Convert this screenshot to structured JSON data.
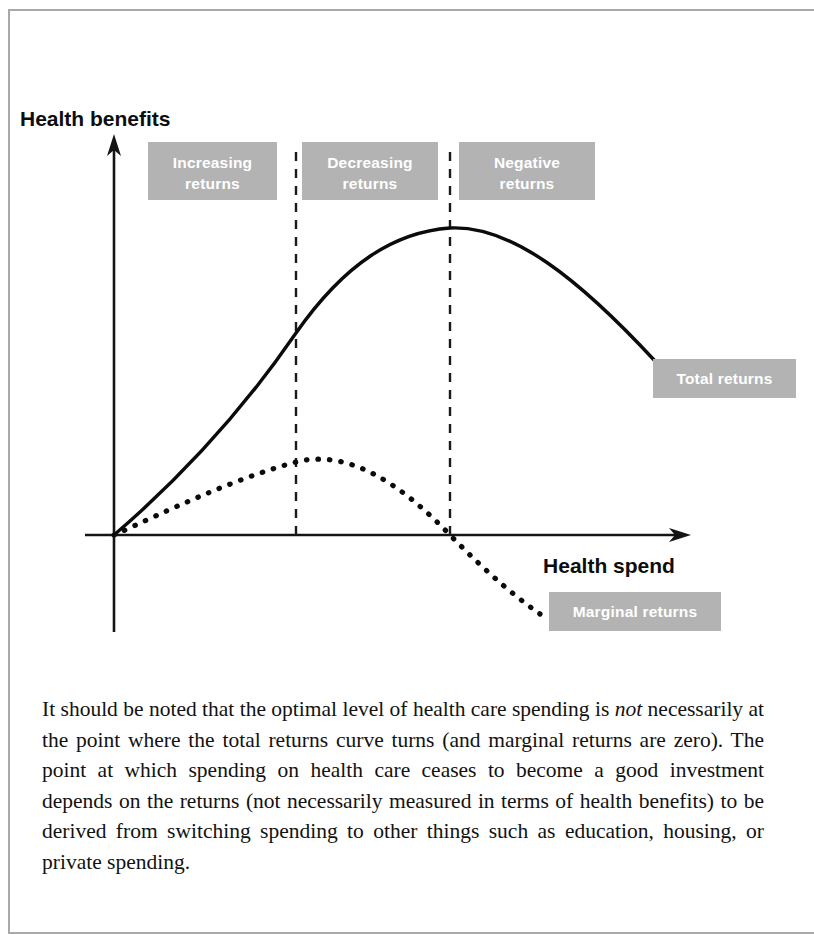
{
  "figure": {
    "y_axis_label": "Health benefits",
    "x_axis_label": "Health spend",
    "zones": [
      {
        "id": "increasing",
        "label_line1": "Increasing",
        "label_line2": "returns"
      },
      {
        "id": "decreasing",
        "label_line1": "Decreasing",
        "label_line2": "returns"
      },
      {
        "id": "negative",
        "label_line1": "Negative",
        "label_line2": "returns"
      }
    ],
    "curve_labels": [
      {
        "id": "total-returns",
        "label": "Total returns"
      },
      {
        "id": "marginal-returns",
        "label": "Marginal returns"
      }
    ],
    "colors": {
      "label_box": "#b3b3b3",
      "label_text": "#ffffff",
      "axis": "#141414",
      "curve": "#0b0b0b",
      "page_rule": "#a9a9a9"
    }
  },
  "chart_data": {
    "type": "line",
    "title": "",
    "xlabel": "Health spend",
    "ylabel": "Health benefits",
    "xlim": [
      0,
      100
    ],
    "ylim": [
      -40,
      100
    ],
    "grid": false,
    "legend": "inline-labels",
    "annotations": [
      {
        "text": "Increasing returns",
        "zone_x_range": [
          0,
          38
        ],
        "kind": "zone-band"
      },
      {
        "text": "Decreasing returns",
        "zone_x_range": [
          38,
          70
        ],
        "kind": "zone-band"
      },
      {
        "text": "Negative returns",
        "zone_x_range": [
          70,
          100
        ],
        "kind": "zone-band"
      },
      {
        "text": "Total returns",
        "at_x": 93,
        "at_y": 44,
        "kind": "curve-label"
      },
      {
        "text": "Marginal returns",
        "at_x": 85,
        "at_y": -24,
        "kind": "curve-label"
      }
    ],
    "vertical_dividers": [
      {
        "x": 38,
        "meaning": "inflection of total returns / peak of marginal returns"
      },
      {
        "x": 70,
        "meaning": "peak of total returns / marginal returns crosses zero"
      }
    ],
    "series": [
      {
        "name": "Total returns",
        "style": "solid",
        "x": [
          0,
          5,
          10,
          15,
          20,
          25,
          30,
          35,
          38,
          40,
          45,
          50,
          55,
          60,
          65,
          70,
          75,
          80,
          85,
          90,
          95,
          100
        ],
        "y": [
          0,
          11,
          22,
          32,
          41,
          49,
          56,
          63,
          66,
          69,
          75,
          80,
          84,
          87,
          89,
          90,
          88,
          84,
          78,
          70,
          60,
          49
        ]
      },
      {
        "name": "Marginal returns",
        "style": "dotted",
        "x": [
          0,
          5,
          10,
          15,
          20,
          25,
          30,
          35,
          38,
          40,
          45,
          50,
          55,
          60,
          65,
          70,
          75,
          80,
          85,
          90
        ],
        "y": [
          0,
          7,
          13,
          18,
          22,
          25,
          27,
          28,
          28,
          27,
          25,
          21,
          16,
          11,
          5,
          0,
          -7,
          -14,
          -22,
          -31
        ]
      }
    ]
  },
  "body": {
    "paragraph_html": "It should be noted that the optimal level of health care spending is <em>not</em> necessarily at the point where the total returns curve turns (and marginal returns are zero). The point at which spending on health care ceases to become a good investment depends on the returns (not necessarily measured in terms of health benefits) to be derived from switching spending to other things such as education, housing, or private spending."
  }
}
